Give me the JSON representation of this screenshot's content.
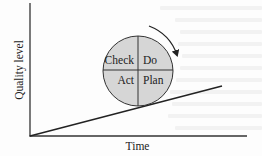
{
  "diagram": {
    "type": "pdca-improvement",
    "title": "",
    "axes": {
      "y_label": "Quality level",
      "x_label": "Time"
    },
    "cycle": {
      "quadrants": {
        "top_left": "Check",
        "top_right": "Do",
        "bottom_left": "Act",
        "bottom_right": "Plan"
      },
      "rotation": "clockwise",
      "fill_color": "#d6d6d6",
      "stroke_color": "#333333"
    },
    "trend_line": {
      "description": "rising quality over time",
      "from": [
        30,
        136
      ],
      "to": [
        222,
        86
      ]
    },
    "colors": {
      "background": "#fdfdfd",
      "ink": "#222222"
    }
  }
}
